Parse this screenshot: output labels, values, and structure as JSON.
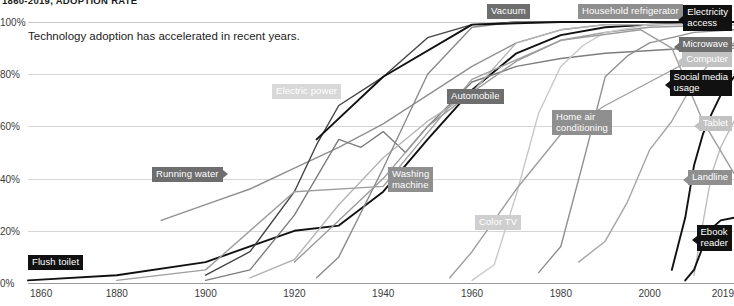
{
  "chart_data": {
    "type": "line",
    "title": "1860-2019, ADOPTION RATE",
    "subtitle": "Technology adoption has accelerated in recent years.",
    "xlabel": "",
    "ylabel": "",
    "xlim": [
      1860,
      2019
    ],
    "ylim": [
      0,
      100
    ],
    "grid": true,
    "legend_position": "inline-and-right-edge",
    "xticks": [
      "1860",
      "1880",
      "1900",
      "1920",
      "1940",
      "1960",
      "1980",
      "2000",
      "2019"
    ],
    "xtick_values": [
      1860,
      1880,
      1900,
      1920,
      1940,
      1960,
      1980,
      2000,
      2019
    ],
    "yticks": [
      "0%",
      "20%",
      "40%",
      "60%",
      "80%",
      "100%"
    ],
    "ytick_values": [
      0,
      20,
      40,
      60,
      80,
      100
    ],
    "series": [
      {
        "name": "Flush toilet",
        "color": "#111111",
        "label_kind": "inline",
        "x": [
          1860,
          1880,
          1900,
          1920,
          1930,
          1940,
          1950,
          1960,
          1970,
          1980,
          1990,
          2000,
          2019
        ],
        "values": [
          1,
          3,
          8,
          20,
          22,
          35,
          55,
          74,
          88,
          95,
          98,
          99,
          100
        ]
      },
      {
        "name": "Running water",
        "color": "#8f8f8f",
        "label_kind": "inline",
        "x": [
          1890,
          1900,
          1910,
          1920,
          1930,
          1940,
          1950,
          1960,
          1970,
          1980,
          1990,
          2000,
          2019
        ],
        "values": [
          24,
          30,
          36,
          44,
          52,
          61,
          72,
          83,
          92,
          97,
          99,
          99,
          100
        ]
      },
      {
        "name": "Electric power",
        "color": "#444444",
        "label_kind": "inline",
        "x": [
          1900,
          1910,
          1920,
          1925,
          1930,
          1940,
          1950,
          1960,
          1970,
          1980,
          2019
        ],
        "values": [
          3,
          12,
          35,
          53,
          68,
          79,
          94,
          99,
          100,
          100,
          100
        ]
      },
      {
        "name": "Automobile",
        "color": "#7d7d7d",
        "label_kind": "inline",
        "x": [
          1900,
          1910,
          1920,
          1930,
          1935,
          1940,
          1945,
          1950,
          1960,
          1970,
          1980,
          1990,
          2019
        ],
        "values": [
          1,
          5,
          26,
          55,
          52,
          58,
          50,
          60,
          77,
          83,
          86,
          88,
          91
        ]
      },
      {
        "name": "Vacuum",
        "color": "#b5b5b5",
        "label_kind": "inline",
        "x": [
          1910,
          1920,
          1930,
          1940,
          1950,
          1960,
          1970,
          1980,
          1990,
          2019
        ],
        "values": [
          2,
          9,
          30,
          48,
          62,
          73,
          92,
          97,
          99,
          99
        ]
      },
      {
        "name": "Washing machine",
        "color": "#9a9a9a",
        "label_kind": "inline",
        "x": [
          1920,
          1930,
          1940,
          1950,
          1960,
          1970,
          1980,
          1990,
          2000,
          2019
        ],
        "values": [
          8,
          24,
          40,
          60,
          73,
          85,
          93,
          96,
          98,
          99
        ]
      },
      {
        "name": "Household refrigerator",
        "color": "#8a8a8a",
        "label_kind": "inline",
        "x": [
          1925,
          1930,
          1940,
          1950,
          1960,
          1970,
          1980,
          2019
        ],
        "values": [
          2,
          10,
          44,
          80,
          98,
          100,
          100,
          100
        ]
      },
      {
        "name": "Color TV",
        "color": "#c9c9c9",
        "label_kind": "inline",
        "x": [
          1960,
          1965,
          1970,
          1975,
          1980,
          1985,
          1990,
          2000,
          2019
        ],
        "values": [
          1,
          7,
          34,
          65,
          83,
          91,
          96,
          99,
          99
        ]
      },
      {
        "name": "Home air conditioning",
        "color": "#9e9e9e",
        "label_kind": "inline",
        "x": [
          1955,
          1960,
          1970,
          1980,
          1990,
          2000,
          2010,
          2019
        ],
        "values": [
          2,
          12,
          36,
          57,
          68,
          77,
          86,
          90
        ]
      },
      {
        "name": "Electricity access",
        "color": "#111111",
        "label_kind": "right",
        "x": [
          1925,
          1940,
          1960,
          1980,
          2000,
          2019
        ],
        "values": [
          55,
          79,
          99,
          100,
          100,
          100
        ]
      },
      {
        "name": "Microwave",
        "color": "#8f8f8f",
        "label_kind": "right",
        "x": [
          1975,
          1980,
          1985,
          1990,
          1995,
          2000,
          2010,
          2019
        ],
        "values": [
          4,
          14,
          46,
          79,
          87,
          92,
          96,
          97
        ]
      },
      {
        "name": "Computer",
        "color": "#a5a5a5",
        "label_kind": "right",
        "x": [
          1984,
          1990,
          1995,
          2000,
          2005,
          2010,
          2015,
          2019
        ],
        "values": [
          8,
          16,
          31,
          51,
          62,
          77,
          87,
          92
        ]
      },
      {
        "name": "Social media usage",
        "color": "#111111",
        "label_kind": "right",
        "x": [
          2005,
          2008,
          2010,
          2012,
          2014,
          2016,
          2019
        ],
        "values": [
          5,
          25,
          45,
          57,
          65,
          72,
          79
        ]
      },
      {
        "name": "Tablet",
        "color": "#bdbdbd",
        "label_kind": "right",
        "x": [
          2010,
          2012,
          2014,
          2016,
          2019
        ],
        "values": [
          3,
          23,
          42,
          52,
          62
        ]
      },
      {
        "name": "Landline",
        "color": "#9e9e9e",
        "label_kind": "right",
        "x": [
          1880,
          1900,
          1920,
          1940,
          1960,
          1980,
          1998,
          2005,
          2012,
          2019
        ],
        "values": [
          1,
          5,
          35,
          37,
          78,
          93,
          97,
          90,
          62,
          42
        ]
      },
      {
        "name": "Ebook reader",
        "color": "#111111",
        "label_kind": "right",
        "x": [
          2008,
          2010,
          2012,
          2014,
          2016,
          2019
        ],
        "values": [
          1,
          5,
          14,
          21,
          24,
          25
        ]
      }
    ],
    "inline_labels": [
      {
        "name": "Vacuum",
        "text": "Vacuum",
        "x": 487,
        "y": 4,
        "style": "dark",
        "arrow": "none"
      },
      {
        "name": "Household refrigerator",
        "text": "Household refrigerator",
        "x": 578,
        "y": 4,
        "style": "mid",
        "arrow": "none"
      },
      {
        "name": "Electric power",
        "text": "Electric power",
        "x": 272,
        "y": 84,
        "style": "pale",
        "arrow": "none"
      },
      {
        "name": "Automobile",
        "text": "Automobile",
        "x": 447,
        "y": 89,
        "style": "dark",
        "arrow": "none"
      },
      {
        "name": "Home air conditioning",
        "text": "Home air\nconditioning",
        "x": 552,
        "y": 110,
        "style": "mid",
        "arrow": "none"
      },
      {
        "name": "Running water",
        "text": "Running water",
        "x": 152,
        "y": 167,
        "style": "dark",
        "arrow": "r"
      },
      {
        "name": "Washing machine",
        "text": "Washing\nmachine",
        "x": 388,
        "y": 167,
        "style": "mid",
        "arrow": "none"
      },
      {
        "name": "Color TV",
        "text": "Color TV",
        "x": 475,
        "y": 215,
        "style": "vpale",
        "arrow": "l"
      },
      {
        "name": "Flush toilet",
        "text": "Flush toilet",
        "x": 28,
        "y": 255,
        "style": "black",
        "arrow": "none"
      }
    ],
    "right_labels": [
      {
        "name": "Electricity access",
        "text": "Electricity\naccess",
        "y": 5,
        "style": "black"
      },
      {
        "name": "Microwave",
        "text": "Microwave",
        "y": 37,
        "style": "dark"
      },
      {
        "name": "Computer",
        "text": "Computer",
        "y": 52,
        "style": "light"
      },
      {
        "name": "Social media usage",
        "text": "Social media\nusage",
        "y": 70,
        "style": "black"
      },
      {
        "name": "Tablet",
        "text": "Tablet",
        "y": 116,
        "style": "light"
      },
      {
        "name": "Landline",
        "text": "Landline",
        "y": 170,
        "style": "mid"
      },
      {
        "name": "Ebook reader",
        "text": "Ebook\nreader",
        "y": 225,
        "style": "black"
      }
    ],
    "colors": {
      "black": "#111111",
      "dark_gray": "#6e6e6e",
      "mid_gray": "#8f8f8f",
      "light_gray": "#c2c2c2",
      "gridline": "#d6d6d6",
      "axis": "#9a9a9a",
      "background": "#ffffff"
    }
  }
}
